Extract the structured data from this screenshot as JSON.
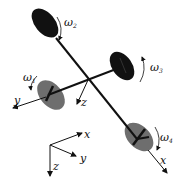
{
  "diagram": {
    "type": "quadrotor-schematic",
    "rotors": [
      {
        "id": 1,
        "label": "ω",
        "subscript": "1",
        "color": "#6e6e6e"
      },
      {
        "id": 2,
        "label": "ω",
        "subscript": "2",
        "color": "#111111"
      },
      {
        "id": 3,
        "label": "ω",
        "subscript": "3",
        "color": "#111111"
      },
      {
        "id": 4,
        "label": "ω",
        "subscript": "4",
        "color": "#6e6e6e"
      }
    ],
    "body_axes": {
      "x": "x",
      "y": "y",
      "z": "z"
    },
    "inertial_axes": {
      "x": "x",
      "y": "y",
      "z": "z"
    },
    "colors": {
      "arm": "#111111",
      "dark_rotor": "#111111",
      "light_rotor": "#6e6e6e"
    }
  }
}
